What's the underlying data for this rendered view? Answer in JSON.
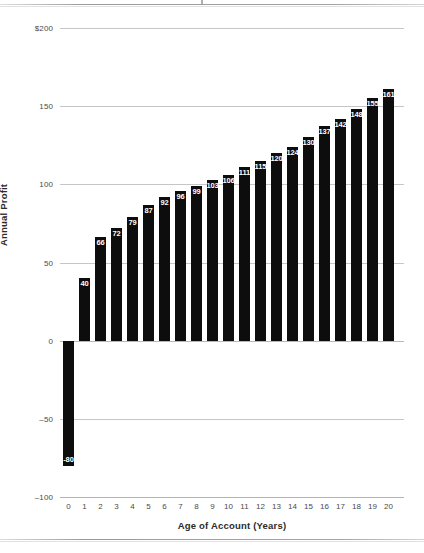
{
  "page": {
    "crop_mark": "crop-mark",
    "rules": [
      "page-rule-top",
      "page-rule-bottom"
    ]
  },
  "chart_data": {
    "type": "bar",
    "title": "",
    "xlabel": "Age of Account (Years)",
    "ylabel": "Annual Profit",
    "categories": [
      "0",
      "1",
      "2",
      "3",
      "4",
      "5",
      "6",
      "7",
      "8",
      "9",
      "10",
      "11",
      "12",
      "13",
      "14",
      "15",
      "16",
      "17",
      "18",
      "19",
      "20"
    ],
    "values": [
      -80,
      40,
      66,
      72,
      79,
      87,
      92,
      96,
      99,
      103,
      106,
      111,
      115,
      120,
      124,
      130,
      137,
      142,
      148,
      155,
      161
    ],
    "bar_labels": [
      "-80",
      "40",
      "66",
      "72",
      "79",
      "87",
      "92",
      "96",
      "99",
      "103",
      "106",
      "111",
      "115",
      "120",
      "124",
      "130",
      "137",
      "142",
      "148",
      "155",
      "161"
    ],
    "ylim": [
      -100,
      200
    ],
    "ytick_values": [
      200,
      150,
      100,
      50,
      0,
      -50,
      -100
    ],
    "ytick_labels": [
      "$200",
      "150",
      "100",
      "50",
      "0",
      "–50",
      "–100"
    ],
    "xtick_labels": [
      "0",
      "1",
      "2",
      "3",
      "4",
      "5",
      "6",
      "7",
      "8",
      "9",
      "10",
      "11",
      "12",
      "13",
      "14",
      "15",
      "16",
      "17",
      "18",
      "19",
      "20"
    ],
    "grid": true,
    "legend": false,
    "bar_color": "#0d0d0d",
    "grid_color": "#c6c6c6",
    "label_text_color": "#ffffff",
    "series": [
      {
        "name": "Annual Profit",
        "values": [
          -80,
          40,
          66,
          72,
          79,
          87,
          92,
          96,
          99,
          103,
          106,
          111,
          115,
          120,
          124,
          130,
          137,
          142,
          148,
          155,
          161
        ]
      }
    ]
  }
}
